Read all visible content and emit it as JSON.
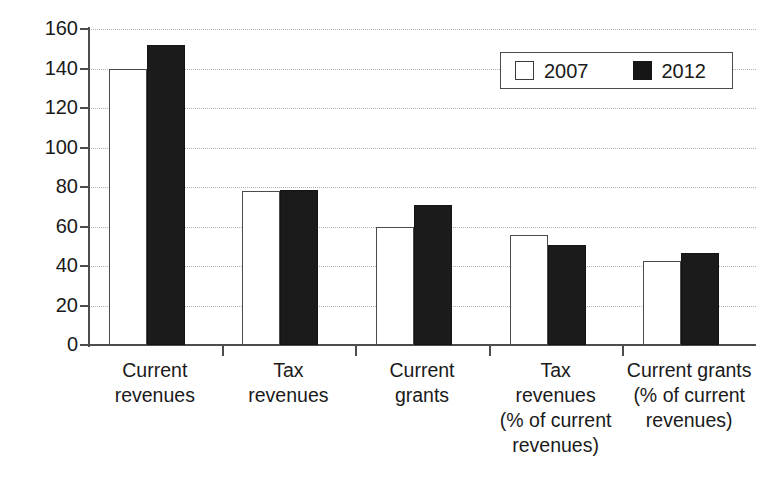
{
  "chart_data": {
    "type": "bar",
    "title": "",
    "subtitle": "",
    "xlabel": "",
    "ylabel": "",
    "ylim": [
      0,
      160
    ],
    "ytick_values": [
      0,
      20,
      40,
      60,
      80,
      100,
      120,
      140,
      160
    ],
    "ytick_labels": [
      "0",
      "20",
      "40",
      "60",
      "80",
      "100",
      "120",
      "140",
      "160"
    ],
    "grid": "horizontal-dotted",
    "legend_position": "top-right",
    "categories": [
      "Current revenues",
      "Tax revenues",
      "Current grants",
      "Tax revenues (% of current revenues)",
      "Current grants (% of current revenues)"
    ],
    "category_lines": [
      [
        "Current",
        "revenues"
      ],
      [
        "Tax",
        "revenues"
      ],
      [
        "Current",
        "grants"
      ],
      [
        "Tax",
        "revenues",
        "(% of current",
        "revenues)"
      ],
      [
        "Current grants",
        "(% of current",
        "revenues)"
      ]
    ],
    "series": [
      {
        "name": "2007",
        "color": "#ffffff",
        "edge_color": "#4a4a4a",
        "values": [
          140,
          78,
          60,
          55.5,
          42.5
        ]
      },
      {
        "name": "2012",
        "color": "#1b1b1b",
        "edge_color": "#141414",
        "values": [
          152,
          78.5,
          71,
          50.5,
          46.5
        ]
      }
    ]
  },
  "legend": {
    "entries": [
      {
        "label": "2007",
        "swatch": "open-square"
      },
      {
        "label": "2012",
        "swatch": "filled-square"
      }
    ]
  },
  "colors": {
    "background": "#ffffff",
    "axis": "#4d4d4d",
    "grid": "#b0b0b0",
    "text": "#1a1a1a",
    "series_2007": "#ffffff",
    "series_2012": "#1b1b1b"
  }
}
